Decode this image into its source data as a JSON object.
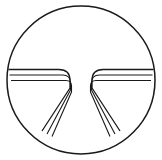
{
  "image": {
    "kind": "line-art-icon",
    "description": "Circular outline icon containing a symmetric funnel / road-merge motif",
    "width": 162,
    "height": 160,
    "background_color": "#ffffff",
    "stroke_color": "#1a1a1a"
  },
  "circle": {
    "name": "outer-circle",
    "center_x": 81,
    "center_y": 80,
    "radius": 74,
    "stroke_width": 1.5,
    "fill": "none"
  },
  "motif": {
    "name": "funnel-merge-symbol",
    "symmetry": "bilateral-vertical",
    "lanes_per_side": 3,
    "center_gap_x": [
      76,
      86
    ],
    "horizontal_lines_y": [
      69.5,
      75.0,
      80.5
    ],
    "stroke_widths": [
      1.3,
      1.1,
      1.1
    ],
    "corner_radius": 11,
    "left": {
      "name": "left-funnel-group",
      "lanes": [
        {
          "name": "left-lane-outer",
          "d": "M 8.5 69.5 L 59 69.5 Q 70 69.5 70 80.5 L 70 88 L 42 131",
          "stroke_width": 1.3
        },
        {
          "name": "left-lane-middle",
          "d": "M 9.5 75 L 62.5 75 Q 70.5 75 70.5 83 L 70.5 90 L 47 134",
          "stroke_width": 1.1
        },
        {
          "name": "left-lane-inner",
          "d": "M 11 80.5 L 66 80.5 Q 71.5 80.5 71.5 86 L 71.5 92 L 52 136.5",
          "stroke_width": 1.1
        }
      ]
    },
    "right": {
      "name": "right-funnel-group",
      "lanes": [
        {
          "name": "right-lane-outer",
          "d": "M 153.5 69.5 L 103 69.5 Q 92 69.5 92 80.5 L 92 88 L 120 131",
          "stroke_width": 1.3
        },
        {
          "name": "right-lane-middle",
          "d": "M 152.5 75 L 99.5 75 Q 91.5 75 91.5 83 L 91.5 90 L 115 134",
          "stroke_width": 1.1
        },
        {
          "name": "right-lane-inner",
          "d": "M 151 80.5 L 96 80.5 Q 90.5 80.5 90.5 86 L 90.5 92 L 110 136.5",
          "stroke_width": 1.1
        }
      ]
    }
  }
}
